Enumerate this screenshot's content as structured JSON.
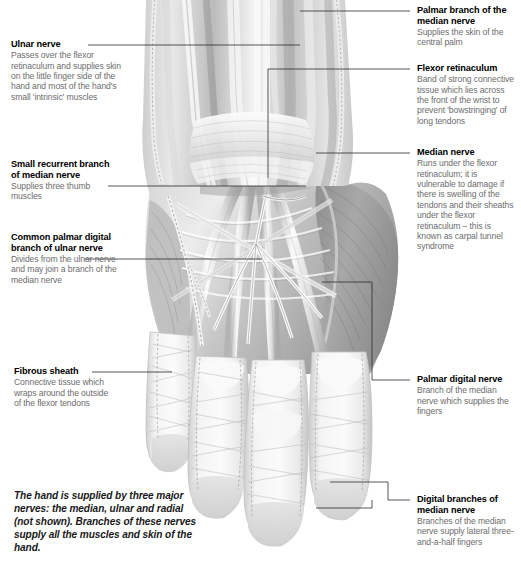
{
  "figure": {
    "type": "anatomical-illustration",
    "view": "anterior (palmar) view of right hand",
    "background_color": "#ffffff",
    "line_color": "#2b2b2b",
    "title_color": "#000000",
    "body_color": "#6d6d6d"
  },
  "summary": "The hand is supplied by three major nerves: the median, ulnar and radial (not shown). Branches of these nerves supply all the muscles and skin of the hand.",
  "labels_left": [
    {
      "id": "ulnar-nerve",
      "title": "Ulnar nerve",
      "body": "Passes over the flexor retinaculum and supplies skin on the little finger side of the hand and most of the hand's small 'intrinsic' muscles"
    },
    {
      "id": "small-recurrent-branch",
      "title": "Small recurrent branch of median nerve",
      "body": "Supplies three thumb muscles"
    },
    {
      "id": "common-palmar-digital-branch",
      "title": "Common palmar digital branch of ulnar nerve",
      "body": "Divides from the ulnar nerve and may join a branch of the median nerve"
    },
    {
      "id": "fibrous-sheath",
      "title": "Fibrous sheath",
      "body": "Connective tissue which wraps around the outside of the flexor tendons"
    }
  ],
  "labels_right": [
    {
      "id": "palmar-branch-median-nerve",
      "title": "Palmar branch of the median nerve",
      "body": "Supplies the skin of the central palm"
    },
    {
      "id": "flexor-retinaculum",
      "title": "Flexor retinaculum",
      "body": "Band of strong connective tissue which lies across the front of the wrist to prevent 'bowstringing' of long tendons"
    },
    {
      "id": "median-nerve",
      "title": "Median nerve",
      "body": "Runs under the flexor retinaculum; it is vulnerable to damage if there is swelling of the tendons and their sheaths under the flexor retinaculum – this is known as carpal tunnel syndrome"
    },
    {
      "id": "palmar-digital-nerve",
      "title": "Palmar digital nerve",
      "body": "Branch of the median nerve which supplies the fingers"
    },
    {
      "id": "digital-branches-median-nerve",
      "title": "Digital branches of median nerve",
      "body": "Branches of the median nerve supply lateral three-and-a-half fingers"
    }
  ]
}
